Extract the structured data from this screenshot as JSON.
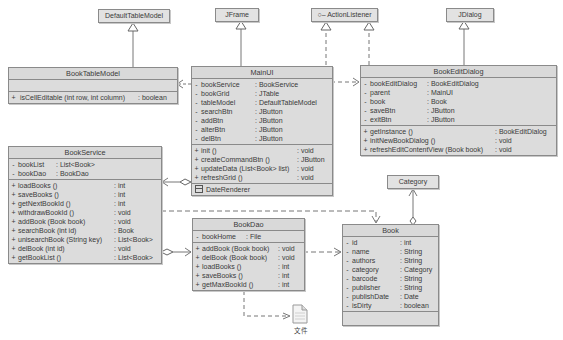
{
  "diagram": {
    "type": "UML class diagram",
    "classes": {
      "defaultTableModel": {
        "name": "DefaultTableModel"
      },
      "jframe": {
        "name": "JFrame"
      },
      "actionListener": {
        "name": "ActionListener",
        "icon": "interface-lollipop-icon",
        "prefix": "○–"
      },
      "jdialog": {
        "name": "JDialog"
      },
      "category": {
        "name": "Category"
      },
      "bookTableModel": {
        "name": "BookTableModel",
        "attributes": [],
        "methods": [
          {
            "vis": "+",
            "name": "isCellEditable (int row, int column)",
            "type": ": boolean"
          }
        ]
      },
      "mainUI": {
        "name": "MainUI",
        "attributes": [
          {
            "vis": "-",
            "name": "bookService",
            "type": ": BookService"
          },
          {
            "vis": "-",
            "name": "bookGrid",
            "type": ": JTable"
          },
          {
            "vis": "-",
            "name": "tableModel",
            "type": ": DefaultTableModel"
          },
          {
            "vis": "-",
            "name": "searchBtn",
            "type": ": JButton"
          },
          {
            "vis": "-",
            "name": "addBtn",
            "type": ": JButton"
          },
          {
            "vis": "-",
            "name": "alterBtn",
            "type": ": JButton"
          },
          {
            "vis": "-",
            "name": "delBtn",
            "type": ": JButton"
          }
        ],
        "methods": [
          {
            "vis": "+",
            "name": "init ()",
            "type": ": void"
          },
          {
            "vis": "+",
            "name": "createCommandBtn ()",
            "type": ": JButton"
          },
          {
            "vis": "+",
            "name": "updateData (List<Book> list)",
            "type": ": void"
          },
          {
            "vis": "+",
            "name": "refreshGrid ()",
            "type": ": void"
          }
        ],
        "inner_class": "DateRenderer"
      },
      "bookEditDialog": {
        "name": "BookEditDialog",
        "attributes": [
          {
            "vis": "-",
            "name": "bookEditDialog",
            "type": ": BookEditDialog"
          },
          {
            "vis": "-",
            "name": "parent",
            "type": ": MainUI"
          },
          {
            "vis": "-",
            "name": "book",
            "type": ": Book"
          },
          {
            "vis": "-",
            "name": "saveBtn",
            "type": ": JButton"
          },
          {
            "vis": "-",
            "name": "exitBtn",
            "type": ": JButton"
          }
        ],
        "methods": [
          {
            "vis": "+",
            "name": "getInstance ()",
            "type": ": BookEditDialog"
          },
          {
            "vis": "+",
            "name": "initNewBookDialog ()",
            "type": ": void"
          },
          {
            "vis": "+",
            "name": "refreshEditContentView (Book book)",
            "type": ": void"
          }
        ]
      },
      "bookService": {
        "name": "BookService",
        "attributes": [
          {
            "vis": "-",
            "name": "bookList",
            "type": ": List<Book>"
          },
          {
            "vis": "-",
            "name": "bookDao",
            "type": ": BookDao"
          }
        ],
        "methods": [
          {
            "vis": "+",
            "name": "loadBooks ()",
            "type": ": int"
          },
          {
            "vis": "+",
            "name": "saveBooks ()",
            "type": ": int"
          },
          {
            "vis": "+",
            "name": "getNextBookId ()",
            "type": ": int"
          },
          {
            "vis": "+",
            "name": "withdrawBookId ()",
            "type": ": void"
          },
          {
            "vis": "+",
            "name": "addBook (Book book)",
            "type": ": void"
          },
          {
            "vis": "+",
            "name": "searchBook (int id)",
            "type": ": Book"
          },
          {
            "vis": "+",
            "name": "unisearchBook (String key)",
            "type": ": List<Book>"
          },
          {
            "vis": "+",
            "name": "delBook (int id)",
            "type": ": void"
          },
          {
            "vis": "+",
            "name": "getBookList ()",
            "type": ": List<Book>"
          }
        ]
      },
      "bookDao": {
        "name": "BookDao",
        "attributes": [
          {
            "vis": "-",
            "name": "bookHome",
            "type": ": File"
          }
        ],
        "methods": [
          {
            "vis": "+",
            "name": "addBook (Book book)",
            "type": ": void"
          },
          {
            "vis": "+",
            "name": "delBook (Book book)",
            "type": ": void"
          },
          {
            "vis": "+",
            "name": "loadBooks ()",
            "type": ": int"
          },
          {
            "vis": "+",
            "name": "saveBooks ()",
            "type": ": int"
          },
          {
            "vis": "+",
            "name": "getMaxBookId ()",
            "type": ": int"
          }
        ]
      },
      "book": {
        "name": "Book",
        "attributes": [
          {
            "vis": "-",
            "name": "id",
            "type": ": int"
          },
          {
            "vis": "-",
            "name": "name",
            "type": ": String"
          },
          {
            "vis": "-",
            "name": "authors",
            "type": ": String"
          },
          {
            "vis": "-",
            "name": "category",
            "type": ": Category"
          },
          {
            "vis": "-",
            "name": "barcode",
            "type": ": String"
          },
          {
            "vis": "-",
            "name": "publisher",
            "type": ": String"
          },
          {
            "vis": "-",
            "name": "publishDate",
            "type": ": Date"
          },
          {
            "vis": "-",
            "name": "isDirty",
            "type": ": boolean"
          }
        ],
        "methods": []
      }
    },
    "file_artifact": {
      "label": "文件",
      "icon": "file-document-icon"
    },
    "relationships": [
      {
        "from": "BookTableModel",
        "to": "DefaultTableModel",
        "kind": "generalization"
      },
      {
        "from": "MainUI",
        "to": "JFrame",
        "kind": "generalization"
      },
      {
        "from": "MainUI",
        "to": "ActionListener",
        "kind": "realization"
      },
      {
        "from": "BookEditDialog",
        "to": "ActionListener",
        "kind": "realization"
      },
      {
        "from": "BookEditDialog",
        "to": "JDialog",
        "kind": "generalization"
      },
      {
        "from": "MainUI",
        "to": "BookTableModel",
        "kind": "dependency"
      },
      {
        "from": "MainUI",
        "to": "BookEditDialog",
        "kind": "dependency"
      },
      {
        "from": "MainUI",
        "to": "BookService",
        "kind": "aggregation"
      },
      {
        "from": "BookService",
        "to": "BookDao",
        "kind": "aggregation"
      },
      {
        "from": "BookService",
        "to": "Book",
        "kind": "dependency"
      },
      {
        "from": "BookDao",
        "to": "Book",
        "kind": "dependency"
      },
      {
        "from": "BookDao",
        "to": "文件",
        "kind": "dependency"
      },
      {
        "from": "Book",
        "to": "Category",
        "kind": "aggregation"
      }
    ]
  }
}
